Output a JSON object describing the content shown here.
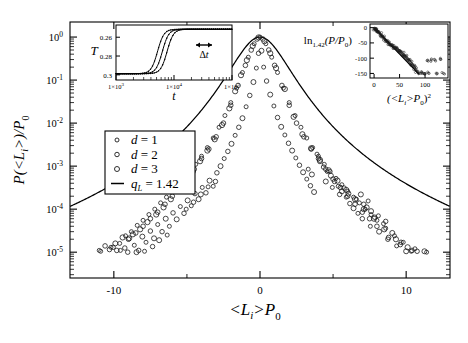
{
  "figure": {
    "background": "#ffffff",
    "line_color": "#000000",
    "marker_color": "#222222"
  },
  "main_axes": {
    "xlabel": "<L_i>P_0",
    "xlabel_parts": {
      "lead": "<L",
      "sub": "i",
      "mid": ">P",
      "sub2": "0"
    },
    "ylabel_parts": {
      "lead": "P(<L",
      "sub": "i",
      "mid": ">)/P",
      "sub2": "0"
    },
    "xticks": [
      "-10",
      "0",
      "10"
    ],
    "xtick_values": [
      -10,
      0,
      10
    ],
    "yticks": [
      "10",
      "10",
      "10",
      "10",
      "10",
      "10"
    ],
    "ytick_exponents": [
      "0",
      "-1",
      "-2",
      "-3",
      "-4",
      "-5"
    ],
    "xlim": [
      -13,
      13
    ],
    "ylim_log": [
      -5.6,
      0.35
    ]
  },
  "legend": {
    "entries": [
      {
        "marker": "circle",
        "label_lead": "d",
        "label_eq": "= 1"
      },
      {
        "marker": "circle",
        "label_lead": "d",
        "label_eq": "= 2"
      },
      {
        "marker": "circle",
        "label_lead": "d",
        "label_eq": "= 3"
      },
      {
        "marker": "line",
        "label_lead": "q",
        "label_sub": "L",
        "label_eq": "= 1.42"
      }
    ]
  },
  "inset_left": {
    "ylabel": "T",
    "xlabel": "t",
    "yticks": [
      "0.3",
      "0.28",
      "0.26"
    ],
    "ytick_values": [
      0.3,
      0.28,
      0.26
    ],
    "xticks": [
      "1×10",
      "1×10",
      "1×10"
    ],
    "xtick_exponents": [
      "3",
      "4",
      "5"
    ],
    "xtick_values": [
      1000,
      10000,
      100000
    ],
    "annotation": "Δt",
    "annotation_icon": "double-arrow-icon"
  },
  "inset_right": {
    "ylabel_parts": {
      "lead": "ln",
      "sub": "1.42",
      "mid": "(P/P",
      "sub2": "0",
      "tail": ")"
    },
    "xlabel_parts": {
      "lead": "(<L",
      "sub": "i",
      "mid": ">P",
      "sub2": "0",
      "tail": ")",
      "sup": "2"
    },
    "yticks": [
      "0",
      "-50",
      "-100",
      "-150"
    ],
    "ytick_values": [
      0,
      -50,
      -100,
      -150
    ],
    "xticks": [
      "0",
      "50",
      "100"
    ],
    "xtick_values": [
      0,
      50,
      100
    ],
    "xlim": [
      -8,
      145
    ],
    "ylim": [
      -165,
      12
    ]
  },
  "chart_data": {
    "type": "scatter",
    "title": "",
    "xlabel": "<L_i>P_0",
    "ylabel": "P(<L_i>)/P_0",
    "xlim": [
      -13,
      13
    ],
    "ylim": [
      1e-06,
      2
    ],
    "yscale": "log",
    "grid": false,
    "legend_position": "left-center",
    "fit_curve": {
      "name": "q_L = 1.42",
      "q": 1.42,
      "form": "q-Gaussian",
      "description": "P/P0 = [1 + (q-1) b x^2]^(1/(1-q)) with q = 1.42",
      "b": 0.62
    },
    "series": [
      {
        "name": "d = 1",
        "marker": "open-circle",
        "x": [
          -11.0,
          -10.2,
          -9.6,
          -9.2,
          -8.8,
          -8.4,
          -8.0,
          -7.6,
          -7.2,
          -6.8,
          -6.4,
          -6.0,
          -5.6,
          -5.2,
          -4.8,
          -4.4,
          -4.0,
          -3.6,
          -3.2,
          -2.8,
          -2.4,
          -2.0,
          -1.6,
          -1.2,
          -0.8,
          -0.4,
          0.0,
          0.4,
          0.8,
          1.2,
          1.6,
          2.0,
          2.4,
          2.8,
          3.2,
          3.6,
          4.0,
          4.4,
          4.8,
          5.2,
          5.6,
          6.0,
          6.4,
          6.8,
          7.2,
          7.6,
          8.0,
          8.6,
          9.2,
          9.8,
          10.6,
          11.4
        ],
        "y": [
          1.1e-05,
          1.3e-05,
          1.6e-05,
          2.4e-05,
          3e-05,
          4.2e-05,
          5.5e-05,
          7.5e-05,
          0.0001,
          0.00014,
          0.00019,
          0.00026,
          0.00037,
          0.00052,
          0.00075,
          0.0011,
          0.0017,
          0.0027,
          0.0045,
          0.008,
          0.015,
          0.03,
          0.065,
          0.15,
          0.34,
          0.7,
          1.0,
          0.7,
          0.34,
          0.15,
          0.065,
          0.03,
          0.015,
          0.008,
          0.0045,
          0.0027,
          0.0017,
          0.0011,
          0.00075,
          0.00052,
          0.00037,
          0.00026,
          0.00019,
          0.00014,
          0.0001,
          7.5e-05,
          5.5e-05,
          3.6e-05,
          2.4e-05,
          1.7e-05,
          1.2e-05,
          1e-05
        ]
      },
      {
        "name": "d = 2",
        "marker": "open-circle",
        "x": [
          -10.6,
          -9.8,
          -9.0,
          -8.5,
          -8.0,
          -7.5,
          -7.0,
          -6.5,
          -6.0,
          -5.5,
          -5.0,
          -4.5,
          -4.0,
          -3.5,
          -3.0,
          -2.5,
          -2.0,
          -1.5,
          -1.0,
          -0.6,
          -0.2,
          0.2,
          0.6,
          1.0,
          1.5,
          2.0,
          2.5,
          3.0,
          3.5,
          4.0,
          4.5,
          5.0,
          5.5,
          6.0,
          6.5,
          7.0,
          7.5,
          8.0,
          8.8,
          9.6,
          10.4
        ],
        "y": [
          1.4e-05,
          1.1e-05,
          2e-05,
          2.8e-05,
          4e-05,
          6e-05,
          8.5e-05,
          0.00013,
          0.0002,
          0.00032,
          0.0005,
          0.00085,
          0.0015,
          0.0025,
          0.0048,
          0.01,
          0.026,
          0.075,
          0.22,
          0.5,
          0.9,
          0.9,
          0.5,
          0.22,
          0.075,
          0.026,
          0.01,
          0.0048,
          0.0025,
          0.0015,
          0.00085,
          0.0005,
          0.00032,
          0.0002,
          0.00013,
          8.5e-05,
          6e-05,
          4e-05,
          2.2e-05,
          1.5e-05,
          1.1e-05
        ]
      },
      {
        "name": "d = 3",
        "marker": "open-circle",
        "x": [
          -9.4,
          -8.7,
          -8.2,
          -7.7,
          -7.1,
          -6.6,
          -6.1,
          -5.6,
          -5.1,
          -4.6,
          -4.1,
          -3.6,
          -3.1,
          -2.6,
          -2.1,
          -1.7,
          -1.3,
          -0.9,
          -0.5,
          -0.1,
          0.3,
          0.7,
          1.1,
          1.7,
          2.3,
          2.9,
          3.5,
          4.1,
          4.7,
          5.3,
          5.9,
          6.5,
          7.1,
          7.8,
          8.5,
          9.3,
          10.1
        ],
        "y": [
          2.2e-05,
          2.6e-05,
          3.4e-05,
          5e-05,
          7.5e-05,
          0.00011,
          0.00017,
          0.00028,
          0.00045,
          0.00075,
          0.0013,
          0.0023,
          0.0042,
          0.009,
          0.022,
          0.055,
          0.13,
          0.29,
          0.62,
          0.98,
          0.8,
          0.42,
          0.19,
          0.062,
          0.014,
          0.0055,
          0.0026,
          0.0014,
          0.0008,
          0.00046,
          0.00028,
          0.00017,
          0.0001,
          6e-05,
          3.4e-05,
          2e-05,
          1.3e-05
        ]
      }
    ],
    "insets": [
      {
        "id": "inset-left",
        "type": "line",
        "xlabel": "t",
        "ylabel": "T",
        "xscale": "log",
        "xlim": [
          1000,
          100000
        ],
        "ylim": [
          0.2545,
          0.313
        ],
        "yticks": [
          0.26,
          0.28,
          0.3
        ],
        "xticks": [
          1000,
          10000,
          100000
        ],
        "annotation": "Δt",
        "series": [
          {
            "name": "curve-1",
            "t0": 5200,
            "width": 0.055,
            "ylow": 0.2612,
            "yhigh": 0.3085
          },
          {
            "name": "curve-2",
            "t0": 6300,
            "width": 0.055,
            "ylow": 0.2612,
            "yhigh": 0.3085
          },
          {
            "name": "curve-3",
            "t0": 7600,
            "width": 0.055,
            "ylow": 0.2612,
            "yhigh": 0.3085
          }
        ]
      },
      {
        "id": "inset-right",
        "type": "scatter",
        "xlabel": "(<L_i>P_0)^2",
        "ylabel": "ln_1.42(P/P_0)",
        "xlim": [
          -8,
          145
        ],
        "ylim": [
          -165,
          12
        ],
        "xticks": [
          0,
          50,
          100
        ],
        "yticks": [
          0,
          -50,
          -100,
          -150
        ],
        "fit_line": {
          "x": [
            0,
            88
          ],
          "y": [
            0,
            -152
          ],
          "slope": -1.727
        },
        "points_x": [
          1,
          2,
          3,
          4,
          5,
          6,
          8,
          10,
          12,
          14,
          16,
          18,
          20,
          22,
          24,
          26,
          28,
          30,
          32,
          34,
          36,
          38,
          40,
          42,
          44,
          46,
          48,
          50,
          52,
          54,
          56,
          58,
          60,
          62,
          64,
          66,
          68,
          70,
          72,
          74,
          76,
          78,
          80,
          82,
          84,
          88,
          92,
          96,
          100,
          104,
          108,
          112,
          118,
          124,
          130,
          136
        ],
        "points_y": [
          -2,
          -4,
          -6,
          -8,
          -9,
          -11,
          -14,
          -18,
          -21,
          -25,
          -28,
          -32,
          -36,
          -39,
          -43,
          -47,
          -50,
          -53,
          -56,
          -58,
          -61,
          -63,
          -64,
          -67,
          -69,
          -71,
          -74,
          -76,
          -79,
          -82,
          -86,
          -90,
          -93,
          -96,
          -99,
          -102,
          -106,
          -110,
          -114,
          -118,
          -122,
          -127,
          -132,
          -137,
          -143,
          -150,
          -150,
          -150,
          -150,
          -108,
          -150,
          -106,
          -104,
          -150,
          -104,
          -150
        ]
      }
    ]
  }
}
